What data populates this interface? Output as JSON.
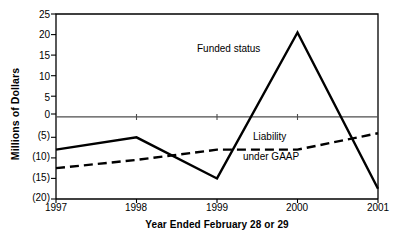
{
  "chart_data": {
    "type": "line",
    "title": "",
    "xlabel": "Year Ended February 28 or 29",
    "ylabel": "Millions of Dollars",
    "x": [
      "1997",
      "1998",
      "1999",
      "2000",
      "2001"
    ],
    "xtick_labels": [
      "1997",
      "1998",
      "1999",
      "2000",
      "2001"
    ],
    "ytick_labels": [
      "25",
      "20",
      "15",
      "10",
      "5",
      "0",
      "(5)",
      "(10)",
      "(15)",
      "(20)"
    ],
    "ytick_values": [
      25,
      20,
      15,
      10,
      5,
      0,
      -5,
      -10,
      -15,
      -20
    ],
    "ylim": [
      -20,
      25
    ],
    "grid": false,
    "legend_position": "inline-annotation",
    "zero_line": 0,
    "series": [
      {
        "name": "Funded status",
        "label": "Funded status",
        "style": "solid",
        "color": "#000000",
        "values": [
          -8,
          -5,
          -15,
          20.5,
          -17.5
        ]
      },
      {
        "name": "Liability under GAAP",
        "label": "Liability",
        "label_line2": "under GAAP",
        "style": "dashed",
        "color": "#000000",
        "values": [
          -12.5,
          -10.5,
          -8,
          -8,
          -4
        ]
      }
    ]
  },
  "colors": {
    "axis": "#000000",
    "zero_line": "#4d4d4d",
    "plot_background": "#ffffff",
    "series_funded": "#000000",
    "series_liability": "#000000"
  }
}
